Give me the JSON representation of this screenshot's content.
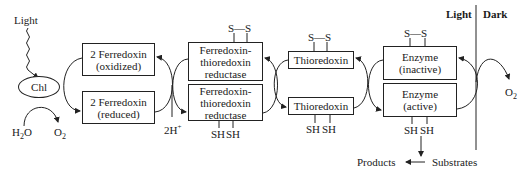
{
  "diagram": {
    "inputs": {
      "light": "Light",
      "chlorophyll": "Chl",
      "water": "H",
      "water_sub": "2",
      "water_tail": "O",
      "oxygen_left": "O",
      "oxygen_left_sub": "2",
      "protons": "2H",
      "protons_sup": "+"
    },
    "ferredoxin": {
      "oxidized": {
        "line1": "2 Ferredoxin",
        "line2": "(oxidized)"
      },
      "reduced": {
        "line1": "2 Ferredoxin",
        "line2": "(reduced)"
      }
    },
    "ftr": {
      "oxidized": {
        "line1": "Ferredoxin-",
        "line2": "thioredoxin",
        "line3": "reductase",
        "group": "S—S"
      },
      "reduced": {
        "line1": "Ferredoxin-",
        "line2": "thioredoxin",
        "line3": "reductase",
        "sh1": "SH",
        "sh2": "SH"
      }
    },
    "thioredoxin": {
      "oxidized": {
        "label": "Thioredoxin",
        "group": "S—S"
      },
      "reduced": {
        "label": "Thioredoxin",
        "sh1": "SH",
        "sh2": "SH"
      }
    },
    "enzyme": {
      "inactive": {
        "line1": "Enzyme",
        "line2": "(inactive)",
        "group": "S—S"
      },
      "active": {
        "line1": "Enzyme",
        "line2": "(active)",
        "sh1": "SH",
        "sh2": "SH"
      }
    },
    "reaction": {
      "products": "Products",
      "substrates": "Substrates"
    },
    "regions": {
      "light": "Light",
      "dark": "Dark",
      "oxygen_right": "O",
      "oxygen_right_sub": "2"
    }
  }
}
